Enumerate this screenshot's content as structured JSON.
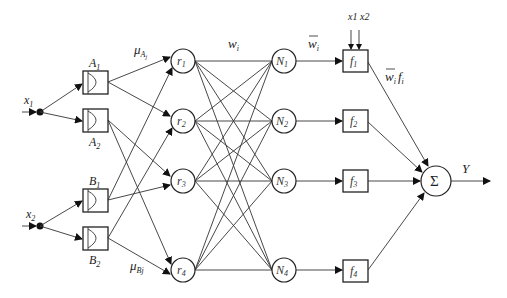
{
  "diagram": {
    "type": "ANFIS network",
    "inputs": [
      {
        "id": "x1",
        "label": "x",
        "sub": "1"
      },
      {
        "id": "x2",
        "label": "x",
        "sub": "2"
      }
    ],
    "membership_functions": [
      {
        "id": "A1",
        "label": "A",
        "sub": "1",
        "input": "x1"
      },
      {
        "id": "A2",
        "label": "A",
        "sub": "2",
        "input": "x1"
      },
      {
        "id": "B1",
        "label": "B",
        "sub": "1",
        "input": "x2"
      },
      {
        "id": "B2",
        "label": "B",
        "sub": "2",
        "input": "x2"
      }
    ],
    "rule_nodes": [
      {
        "id": "r1",
        "label": "r",
        "sub": "1"
      },
      {
        "id": "r2",
        "label": "r",
        "sub": "2"
      },
      {
        "id": "r3",
        "label": "r",
        "sub": "3"
      },
      {
        "id": "r4",
        "label": "r",
        "sub": "4"
      }
    ],
    "norm_nodes": [
      {
        "id": "N1",
        "label": "N",
        "sub": "1"
      },
      {
        "id": "N2",
        "label": "N",
        "sub": "2"
      },
      {
        "id": "N3",
        "label": "N",
        "sub": "3"
      },
      {
        "id": "N4",
        "label": "N",
        "sub": "4"
      }
    ],
    "consequent_nodes": [
      {
        "id": "f1",
        "label": "f",
        "sub": "1"
      },
      {
        "id": "f2",
        "label": "f",
        "sub": "2"
      },
      {
        "id": "f3",
        "label": "f",
        "sub": "3"
      },
      {
        "id": "f4",
        "label": "f",
        "sub": "4"
      }
    ],
    "sum_node": {
      "label": "Σ"
    },
    "output": {
      "label": "Y"
    },
    "edge_labels": {
      "mu_A": {
        "main": "μ",
        "sub": "A",
        "subsub": "j"
      },
      "mu_B": {
        "main": "μ",
        "sub": "Bj"
      },
      "w": {
        "main": "w",
        "sub": "i"
      },
      "wbar": {
        "main": "w",
        "sub": "i"
      },
      "wbar_f": {
        "main": "w",
        "sub": "i",
        "f": "f",
        "fsub": "i"
      },
      "f1_inputs": "x1 x2"
    }
  }
}
